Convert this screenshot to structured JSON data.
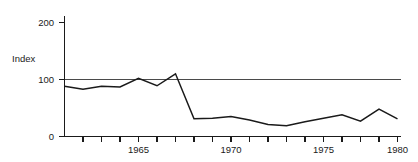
{
  "chart_data": {
    "type": "line",
    "title": "",
    "subtitle": "",
    "xlabel": "",
    "ylabel": "Index",
    "ylim": [
      0,
      215
    ],
    "xlim": [
      1961.5,
      1980
    ],
    "grid": false,
    "legend": null,
    "y_ticks": [
      0,
      100,
      200
    ],
    "y_tick_labels": [
      "0",
      "100",
      "200"
    ],
    "x_ticks": [
      1962,
      1963,
      1964,
      1965,
      1966,
      1967,
      1968,
      1969,
      1970,
      1971,
      1972,
      1973,
      1974,
      1975,
      1976,
      1977,
      1978,
      1979,
      1980
    ],
    "x_tick_labels": [
      "",
      "",
      "",
      "1965",
      "",
      "",
      "",
      "",
      "1970",
      "",
      "",
      "",
      "",
      "1975",
      "",
      "",
      "",
      "",
      "1980"
    ],
    "reference_line": {
      "value": 100,
      "label": "",
      "color": "#4a4a4a"
    },
    "series": [
      {
        "name": "Index",
        "color": "#1a1a1a",
        "x": [
          1962,
          1963,
          1964,
          1965,
          1966,
          1967,
          1968,
          1969,
          1970,
          1971,
          1972,
          1973,
          1974,
          1975,
          1976,
          1977,
          1978,
          1979,
          1980
        ],
        "values": [
          88,
          83,
          88,
          87,
          102,
          89,
          110,
          31,
          32,
          35,
          29,
          21,
          19,
          26,
          32,
          38,
          27,
          48,
          31
        ]
      }
    ]
  },
  "axis": {
    "y_axis_title": "Index",
    "tick_200": "200",
    "tick_100": "100",
    "tick_0": "0",
    "tick_1965": "1965",
    "tick_1970": "1970",
    "tick_1975": "1975",
    "tick_1980": "1980"
  }
}
